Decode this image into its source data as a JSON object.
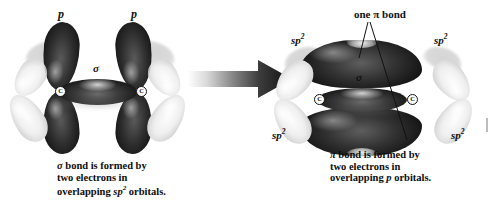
{
  "figure": {
    "type": "chemistry-orbital-diagram",
    "ink_color": "#111111",
    "orbital_dark_color": "#1e1e1e",
    "orbital_light_color": "#e8e8e8"
  },
  "left_diagram": {
    "name": "unhybridized-p-orbitals-and-sigma-bond",
    "labels": {
      "p_left": "p",
      "p_right": "p",
      "sigma": "σ",
      "carbon_left": "C",
      "carbon_right": "C"
    },
    "caption": {
      "line1_symbol": "σ",
      "line1_rest": " bond is formed by",
      "line2": "two electrons in",
      "line3_prefix": "overlapping ",
      "line3_italic": "sp",
      "line3_superscript": "2",
      "line3_suffix": " orbitals."
    }
  },
  "arrow": {
    "name": "transformation-arrow",
    "direction": "right",
    "style": "gradient-block-arrow"
  },
  "right_diagram": {
    "name": "pi-bond-formed",
    "labels": {
      "pi_callout": "one π bond",
      "sigma": "σ",
      "sp2_top_left": "sp",
      "sp2_top_left_sup": "2",
      "sp2_top_right": "sp",
      "sp2_top_right_sup": "2",
      "sp2_bottom_left": "sp",
      "sp2_bottom_left_sup": "2",
      "sp2_bottom_right": "sp",
      "sp2_bottom_right_sup": "2",
      "carbon_left": "C",
      "carbon_right": "C"
    },
    "caption": {
      "line1_symbol": "π",
      "line1_rest": " bond is formed by",
      "line2": "two electrons in",
      "line3_prefix": "overlapping ",
      "line3_italic": "p",
      "line3_suffix": " orbitals."
    }
  }
}
